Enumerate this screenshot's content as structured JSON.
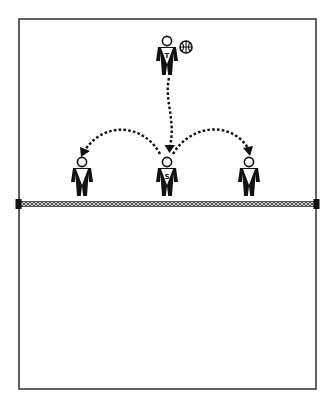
{
  "diagram": {
    "title": "",
    "court": {
      "x": 19,
      "y": 19,
      "width": 297,
      "height": 370,
      "line_color": "#3a3a3a",
      "net": {
        "y": 204,
        "left_post_x": 19,
        "right_post_x": 316,
        "pattern": "crosshatch",
        "post_color": "#111111"
      }
    },
    "players": [
      {
        "id": "tosser",
        "label": "T",
        "x": 167,
        "y": 55,
        "has_ball": true
      },
      {
        "id": "left-player",
        "label": "",
        "x": 82,
        "y": 176,
        "has_ball": false
      },
      {
        "id": "setter",
        "label": "S",
        "x": 167,
        "y": 176,
        "has_ball": false
      },
      {
        "id": "right-player",
        "label": "",
        "x": 249,
        "y": 176,
        "has_ball": false
      }
    ],
    "ball": {
      "x": 186,
      "y": 47,
      "icon": "basketball-icon"
    },
    "passes": [
      {
        "from": "tosser",
        "to": "setter",
        "style": "dashed-arrow"
      },
      {
        "from": "setter",
        "to": "left-player",
        "style": "dashed-arrow"
      },
      {
        "from": "setter",
        "to": "right-player",
        "style": "dashed-arrow"
      }
    ]
  }
}
